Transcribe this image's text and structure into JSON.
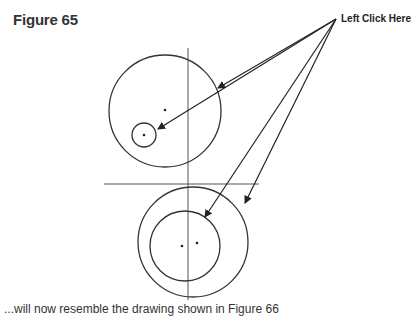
{
  "figure": {
    "title": "Figure 65",
    "callout_label": "Left Click Here",
    "caption_fragment": "...will now resemble the drawing shown in Figure 66"
  },
  "colors": {
    "stroke": "#333333",
    "text": "#333333",
    "background": "#ffffff"
  }
}
